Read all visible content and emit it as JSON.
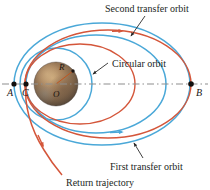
{
  "figure": {
    "title_labels": {
      "second_transfer_orbit": "Second transfer orbit",
      "circular_orbit": "Circular orbit",
      "first_transfer_orbit": "First transfer orbit",
      "return_trajectory": "Return trajectory"
    },
    "point_labels": {
      "a": "A",
      "b": "B",
      "c": "C"
    },
    "planet_labels": {
      "radius": "R",
      "center": "O"
    },
    "colors": {
      "blue_orbit": "#4aa8d8",
      "red_orbit": "#d4563a",
      "axis_dash": "#8d8d8d",
      "leader_line": "#2b2b2b",
      "point_dot": "#120f0e",
      "planet_body": "#9a7a5c",
      "planet_shadow": "#4a3c31",
      "background": "#ffffff",
      "text": "#231f1d"
    },
    "geometry": {
      "axis_y": 84,
      "point_a_x": 14,
      "point_c_x": 26,
      "point_b_x": 191,
      "planet_center_x": 56,
      "planet_center_y": 84,
      "planet_radius": 22
    }
  }
}
